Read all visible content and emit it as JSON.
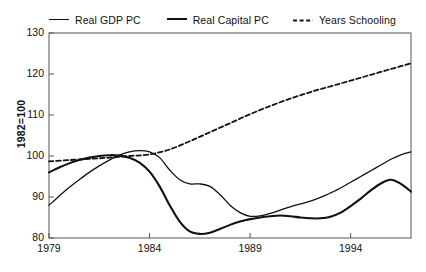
{
  "chart_data": {
    "type": "line",
    "title": "",
    "xlabel": "",
    "ylabel": "1982=100",
    "xlim": [
      1979,
      1997
    ],
    "ylim": [
      80,
      130
    ],
    "xticks": [
      "1979",
      "1984",
      "1989",
      "1994"
    ],
    "xtick_values": [
      1979,
      1984,
      1989,
      1994
    ],
    "yticks": [
      "80",
      "90",
      "100",
      "110",
      "120",
      "130"
    ],
    "ytick_values": [
      80,
      90,
      100,
      110,
      120,
      130
    ],
    "grid": false,
    "legend_position": "above-plot",
    "series": [
      {
        "name": "Real GDP PC",
        "style": "solid-thin",
        "color": "#111111",
        "x": [
          1979,
          1979.5,
          1980,
          1980.5,
          1981,
          1981.5,
          1982,
          1982.5,
          1983,
          1983.5,
          1984,
          1984.5,
          1985,
          1985.5,
          1986,
          1986.5,
          1987,
          1987.5,
          1988,
          1988.5,
          1989,
          1989.5,
          1990,
          1990.5,
          1991,
          1991.5,
          1992,
          1992.5,
          1993,
          1993.5,
          1994,
          1994.5,
          1995,
          1995.5,
          1996,
          1996.5,
          1997
        ],
        "values": [
          88.0,
          90.2,
          92.3,
          94.2,
          96.0,
          97.6,
          99.0,
          100.2,
          101.0,
          101.3,
          101.0,
          99.6,
          96.6,
          94.2,
          93.2,
          93.2,
          92.6,
          90.6,
          88.0,
          86.2,
          85.3,
          85.4,
          86.0,
          86.8,
          87.6,
          88.3,
          89.0,
          89.9,
          91.0,
          92.2,
          93.6,
          95.0,
          96.4,
          97.8,
          99.2,
          100.3,
          101.0
        ]
      },
      {
        "name": "Real Capital PC",
        "style": "solid-thick",
        "color": "#111111",
        "x": [
          1979,
          1979.5,
          1980,
          1980.5,
          1981,
          1981.5,
          1982,
          1982.5,
          1983,
          1983.5,
          1984,
          1984.5,
          1985,
          1985.5,
          1986,
          1986.5,
          1987,
          1987.5,
          1988,
          1988.5,
          1989,
          1989.5,
          1990,
          1990.5,
          1991,
          1991.5,
          1992,
          1992.5,
          1993,
          1993.5,
          1994,
          1994.5,
          1995,
          1995.5,
          1996,
          1996.5,
          1997
        ],
        "values": [
          96.0,
          97.2,
          98.2,
          99.0,
          99.6,
          100.0,
          100.2,
          100.1,
          99.6,
          98.4,
          96.2,
          92.6,
          88.0,
          84.0,
          81.6,
          81.0,
          81.3,
          82.2,
          83.2,
          84.0,
          84.6,
          85.0,
          85.3,
          85.5,
          85.3,
          85.0,
          84.8,
          84.8,
          85.2,
          86.2,
          87.8,
          89.6,
          91.6,
          93.3,
          94.2,
          93.2,
          91.3
        ]
      },
      {
        "name": "Years Schooling",
        "style": "dashed",
        "color": "#111111",
        "x": [
          1979,
          1980,
          1981,
          1982,
          1983,
          1984,
          1985,
          1986,
          1987,
          1988,
          1989,
          1990,
          1991,
          1992,
          1993,
          1994,
          1995,
          1996,
          1997
        ],
        "values": [
          98.7,
          99.0,
          99.3,
          99.6,
          100.0,
          100.4,
          101.6,
          103.6,
          105.8,
          108.0,
          110.2,
          112.2,
          114.0,
          115.6,
          117.0,
          118.4,
          119.8,
          121.2,
          122.6
        ]
      }
    ]
  },
  "legend": {
    "items": [
      {
        "label": "Real GDP PC",
        "style": "solid-thin"
      },
      {
        "label": "Real Capital PC",
        "style": "solid-thick"
      },
      {
        "label": "Years Schooling",
        "style": "dashed"
      }
    ]
  }
}
